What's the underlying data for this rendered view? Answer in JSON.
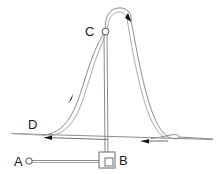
{
  "diagram": {
    "type": "line-diagram",
    "background_color": "#ffffff",
    "line_color": "#8c8c8c",
    "label_color": "#1a1a1a",
    "arrow_color": "#141414",
    "canvas": {
      "width": 222,
      "height": 174
    },
    "labels": [
      {
        "id": "label-a",
        "text": "A",
        "x": 14,
        "y": 166
      },
      {
        "id": "label-b",
        "text": "B",
        "x": 122,
        "y": 164
      },
      {
        "id": "label-c",
        "text": "C",
        "x": 86,
        "y": 34
      },
      {
        "id": "label-d",
        "text": "D",
        "x": 29,
        "y": 127
      }
    ],
    "nodes": [
      {
        "id": "node-a",
        "name": "point-a-pin",
        "cx": 29,
        "cy": 161,
        "r": 3.2
      },
      {
        "id": "node-c",
        "name": "point-c-pulley",
        "cx": 105,
        "cy": 31,
        "r": 3.4
      }
    ],
    "box": {
      "name": "block-b",
      "x": 99,
      "y": 152,
      "width": 16,
      "height": 16,
      "inner": {
        "x": 105,
        "y": 158,
        "width": 8,
        "height": 8
      }
    },
    "arrows": [
      {
        "id": "arrow-top-loop",
        "direction": "down-right",
        "x": 125,
        "y": 17
      },
      {
        "id": "arrow-curve-d",
        "direction": "up-right",
        "x": 69,
        "y": 99
      },
      {
        "id": "arrow-ground-left",
        "direction": "left",
        "x": 46,
        "y": 137
      },
      {
        "id": "arrow-ground-right",
        "direction": "left",
        "x": 143,
        "y": 141
      }
    ],
    "ground_line": {
      "x1": 11,
      "y1": 133,
      "x2": 213,
      "y2": 139
    }
  }
}
